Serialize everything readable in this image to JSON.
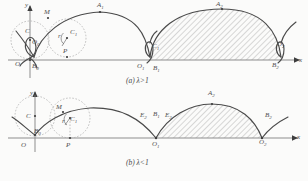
{
  "figure": {
    "kind": "mathematical-diagram",
    "ink_color": "#4a4a4a",
    "axis_color": "#8d8d8d",
    "paper_color": "#fbfbfa"
  },
  "panel_a": {
    "caption": "(a)  λ>1",
    "axes": {
      "y_label": "y",
      "x_label": "x",
      "origin_label": "O"
    },
    "labels": [
      {
        "id": "y-axis-label",
        "text": "y",
        "x": 25,
        "y": 3
      },
      {
        "id": "point-M",
        "text": "M",
        "x": 44,
        "y": 10
      },
      {
        "id": "point-A1",
        "text": "A",
        "sub": "1",
        "x": 97,
        "y": 4
      },
      {
        "id": "point-A2",
        "text": "A",
        "sub": "2",
        "x": 215,
        "y": 4
      },
      {
        "id": "point-C",
        "text": "C",
        "x": 28,
        "y": 29
      },
      {
        "id": "point-O0",
        "text": "O",
        "sub": "0",
        "x": 33,
        "y": 40
      },
      {
        "id": "radius-r",
        "text": "r",
        "x": 57,
        "y": 33
      },
      {
        "id": "circle-C1",
        "text": "C",
        "sub": "1",
        "x": 70,
        "y": 29
      },
      {
        "id": "point-P",
        "text": "P",
        "x": 62,
        "y": 48
      },
      {
        "id": "point-O",
        "text": "O",
        "x": 15,
        "y": 62
      },
      {
        "id": "point-B0",
        "text": "B",
        "sub": "0",
        "x": 32,
        "y": 65
      },
      {
        "id": "point-C1r",
        "text": "C",
        "sub": "1",
        "x": 150,
        "y": 45
      },
      {
        "id": "point-O1",
        "text": "O",
        "sub": "1",
        "x": 137,
        "y": 64
      },
      {
        "id": "point-B1",
        "text": "B",
        "sub": "1",
        "x": 152,
        "y": 66
      },
      {
        "id": "point-O2",
        "text": "O",
        "sub": "2",
        "x": 276,
        "y": 42
      },
      {
        "id": "point-B2",
        "text": "B",
        "sub": "2",
        "x": 271,
        "y": 62
      },
      {
        "id": "x-axis-label",
        "text": "x",
        "x": 299,
        "y": 58
      }
    ]
  },
  "panel_b": {
    "caption": "(b)  λ<1",
    "axes": {
      "y_label": "y",
      "x_label": "x",
      "origin_label": "O"
    },
    "labels": [
      {
        "id": "y-axis-label",
        "text": "y",
        "x": 30,
        "y": 0
      },
      {
        "id": "circle-C",
        "text": "C",
        "x": 27,
        "y": 24
      },
      {
        "id": "point-M",
        "text": "M",
        "x": 57,
        "y": 16
      },
      {
        "id": "radius-r",
        "text": "r",
        "x": 62,
        "y": 29
      },
      {
        "id": "circle-C1",
        "text": "C",
        "sub": "1",
        "x": 70,
        "y": 27
      },
      {
        "id": "point-B0",
        "text": "B",
        "sub": "0",
        "x": 34,
        "y": 39
      },
      {
        "id": "point-O",
        "text": "O",
        "x": 21,
        "y": 53
      },
      {
        "id": "point-P",
        "text": "P",
        "x": 66,
        "y": 53
      },
      {
        "id": "point-E2",
        "text": "E",
        "sub": "2",
        "x": 144,
        "y": 23
      },
      {
        "id": "point-B1",
        "text": "B",
        "sub": "1",
        "x": 156,
        "y": 22
      },
      {
        "id": "point-E3",
        "text": "E",
        "sub": "3",
        "x": 167,
        "y": 23
      },
      {
        "id": "point-A2",
        "text": "A",
        "sub": "2",
        "x": 207,
        "y": 0
      },
      {
        "id": "point-O1",
        "text": "O",
        "sub": "1",
        "x": 153,
        "y": 52
      },
      {
        "id": "point-B2",
        "text": "B",
        "sub": "2",
        "x": 265,
        "y": 23
      },
      {
        "id": "point-O2",
        "text": "O",
        "sub": "2",
        "x": 261,
        "y": 50
      },
      {
        "id": "x-axis-label",
        "text": "x",
        "x": 297,
        "y": 45
      }
    ]
  }
}
